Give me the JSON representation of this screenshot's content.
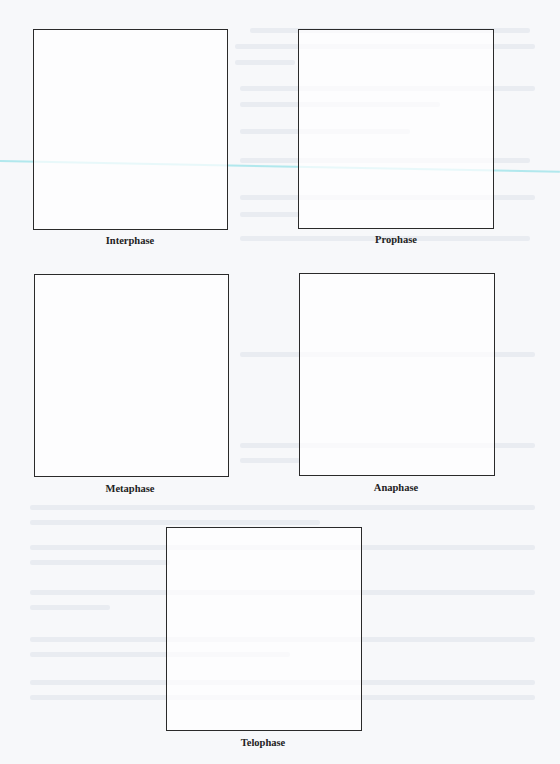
{
  "worksheet": {
    "phases": [
      {
        "label": "Interphase"
      },
      {
        "label": "Prophase"
      },
      {
        "label": "Metaphase"
      },
      {
        "label": "Anaphase"
      },
      {
        "label": "Telophase"
      }
    ]
  },
  "colors": {
    "page": "#f7f8fa",
    "border": "#2a2a2a",
    "highlight_line": "#9fe3ea"
  }
}
